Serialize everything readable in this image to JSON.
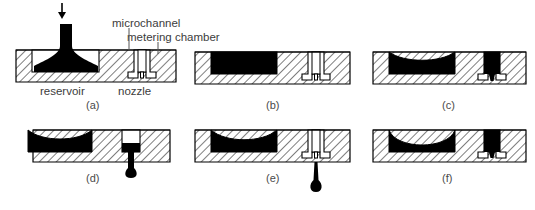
{
  "figure": {
    "title": "",
    "panels": [
      {
        "id": "a",
        "label": "(a)",
        "state": "liquid loaded into reservoir, chamber empty"
      },
      {
        "id": "b",
        "label": "(b)",
        "state": "reservoir full, metering chamber empty"
      },
      {
        "id": "c",
        "label": "(c)",
        "state": "liquid drawn toward nozzle, meniscus forming"
      },
      {
        "id": "d",
        "label": "(d)",
        "state": "droplet emerging from nozzle"
      },
      {
        "id": "e",
        "label": "(e)",
        "state": "droplet detached and falling"
      },
      {
        "id": "f",
        "label": "(f)",
        "state": "nozzle refilled, deeper meniscus"
      }
    ],
    "callouts": [
      {
        "name": "microchannel",
        "text": "microchannel"
      },
      {
        "name": "metering-chamber",
        "text": "metering chamber"
      },
      {
        "name": "reservoir",
        "text": "reservoir"
      },
      {
        "name": "nozzle",
        "text": "nozzle"
      }
    ],
    "colors": {
      "liquid": "#000000",
      "body_outline": "#000000",
      "hatch": "#000000",
      "text": "#3c3c3c",
      "background": "#ffffff"
    },
    "inlet_arrow": "down-arrow"
  }
}
